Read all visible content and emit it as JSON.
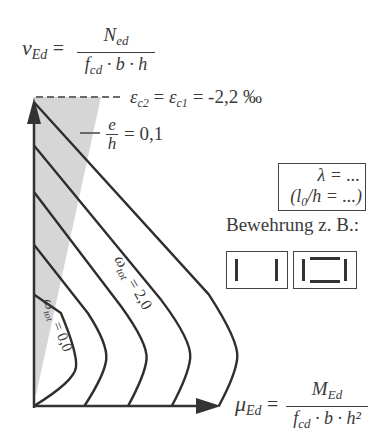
{
  "figure": {
    "y_axis": {
      "symbol": "ν",
      "subscript": "Ed",
      "equals": "=",
      "numerator": "N",
      "numerator_sub": "ed",
      "denominator": "f",
      "denominator_sub": "cd",
      "denominator_rest": " · b · h"
    },
    "x_axis": {
      "symbol": "μ",
      "subscript": "Ed",
      "equals": "=",
      "numerator": "M",
      "numerator_sub": "Ed",
      "denominator": "f",
      "denominator_sub": "cd",
      "denominator_rest": " · b · h²"
    },
    "strain_label": {
      "eps": "ε",
      "sub1": "c2",
      "eq1": " = ",
      "eps2": "ε",
      "sub2": "c1",
      "rest": " = -2,2 ‰"
    },
    "eccentricity_label": {
      "num": "e",
      "den": "h",
      "rest": "= 0,1"
    },
    "slenderness_box": {
      "line1": "λ = ...",
      "line2_open": "(l",
      "line2_sub": "0",
      "line2_rest": "/h = ...)"
    },
    "reinforcement_label": "Bewehrung z. B.:",
    "curve_labels": {
      "high": {
        "omega": "ω",
        "sub": "tot",
        "value": " = 2,0"
      },
      "low": {
        "omega": "ω",
        "sub": "tot",
        "value": " = 0,0"
      }
    },
    "colors": {
      "line": "#2e2e2e",
      "shade": "#d4d4d4",
      "text": "#3b3b3b"
    }
  },
  "chart_data": {
    "type": "line",
    "xlabel": "μEd = MEd / (fcd · b · h²)",
    "ylabel": "νEd = Ned / (fcd · b · h)",
    "grid": false,
    "legend": "none",
    "xlim": [
      0,
      1
    ],
    "ylim": [
      0,
      1
    ],
    "series": [
      {
        "name": "ω_tot = 0,0",
        "omega": 0.0,
        "points": [
          [
            0.0,
            0.36
          ],
          [
            0.08,
            0.3
          ],
          [
            0.13,
            0.17
          ],
          [
            0.12,
            0.08
          ],
          [
            0.0,
            0.0
          ]
        ]
      },
      {
        "name": "ω_tot = 0,5",
        "omega": 0.5,
        "points": [
          [
            0.0,
            0.52
          ],
          [
            0.16,
            0.3
          ],
          [
            0.22,
            0.2
          ],
          [
            0.21,
            0.1
          ],
          [
            0.15,
            0.0
          ]
        ]
      },
      {
        "name": "ω_tot = 1,0",
        "omega": 1.0,
        "points": [
          [
            0.0,
            0.69
          ],
          [
            0.26,
            0.32
          ],
          [
            0.34,
            0.2
          ],
          [
            0.33,
            0.1
          ],
          [
            0.28,
            0.0
          ]
        ]
      },
      {
        "name": "ω_tot = 1,5",
        "omega": 1.5,
        "points": [
          [
            0.0,
            0.84
          ],
          [
            0.38,
            0.34
          ],
          [
            0.47,
            0.21
          ],
          [
            0.46,
            0.1
          ],
          [
            0.41,
            0.0
          ]
        ]
      },
      {
        "name": "ω_tot = 2,0",
        "omega": 2.0,
        "points": [
          [
            0.0,
            0.98
          ],
          [
            0.52,
            0.36
          ],
          [
            0.61,
            0.21
          ],
          [
            0.6,
            0.1
          ],
          [
            0.55,
            0.0
          ]
        ]
      }
    ],
    "annotations": [
      "εc2 = εc1 = -2,2 ‰ (dashed line at top)",
      "e/h = 0,1 (shaded region boundary)"
    ]
  }
}
